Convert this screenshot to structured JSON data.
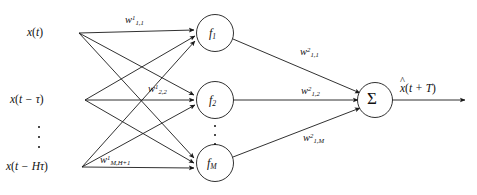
{
  "diagram": {
    "stroke_color": "#1a1a1a",
    "background_color": "#ffffff",
    "inputs": [
      {
        "id": "x-t",
        "text_main": "x",
        "text_paren_open": "(",
        "text_arg": "t",
        "text_paren_close": ")"
      },
      {
        "id": "x-t-tau",
        "text_main": "x",
        "text_paren_open": "(",
        "text_arg": "t − τ",
        "text_paren_close": ")"
      },
      {
        "id": "x-t-Htau",
        "text_main": "x",
        "text_paren_open": "(",
        "text_arg": "t − Hτ",
        "text_paren_close": ")"
      }
    ],
    "input_labels_plain": [
      "x(t)",
      "x(t − τ)",
      "x(t − Hτ)"
    ],
    "hidden_nodes": [
      {
        "id": "f1",
        "base": "f",
        "sub": "1"
      },
      {
        "id": "f2",
        "base": "f",
        "sub": "2"
      },
      {
        "id": "fM",
        "base": "f",
        "sub": "M"
      }
    ],
    "hidden_labels_plain": [
      "f₁",
      "f₂",
      "fₘ"
    ],
    "sum_node": {
      "id": "sigma",
      "symbol": "Σ"
    },
    "output": {
      "id": "x-hat",
      "hat": "^",
      "base": "x",
      "paren_open": "(",
      "arg": "t + T",
      "paren_close": ")",
      "plain": "x̂(t + T)"
    },
    "layer1_weights": [
      {
        "id": "w1-11",
        "base": "w",
        "sup": "1",
        "sub": "1,1"
      },
      {
        "id": "w1-22",
        "base": "w",
        "sup": "1",
        "sub": "2,2"
      },
      {
        "id": "w1-MH1",
        "base": "w",
        "sup": "1",
        "sub": "M,H+1"
      }
    ],
    "layer1_weights_plain": [
      "w¹₁,₁",
      "w¹₂,₂",
      "w¹M,H+1"
    ],
    "layer2_weights": [
      {
        "id": "w2-11",
        "base": "w",
        "sup": "2",
        "sub": "1,1"
      },
      {
        "id": "w2-12",
        "base": "w",
        "sup": "2",
        "sub": "1,2"
      },
      {
        "id": "w2-1M",
        "base": "w",
        "sup": "2",
        "sub": "1,M"
      }
    ],
    "layer2_weights_plain": [
      "w²₁,₁",
      "w²₁,₂",
      "w²₁,M"
    ],
    "ellipsis_symbol": "⋮"
  }
}
